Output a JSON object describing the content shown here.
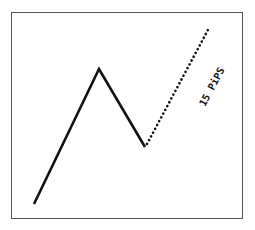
{
  "diagram": {
    "label": "15 PiPS",
    "colors": {
      "line": "#111111",
      "border": "#555555",
      "background": "#ffffff"
    },
    "solid_path": [
      [
        34,
        204
      ],
      [
        99,
        69
      ],
      [
        145,
        147
      ]
    ],
    "dotted_path": [
      [
        145,
        147
      ],
      [
        209,
        28
      ]
    ]
  }
}
